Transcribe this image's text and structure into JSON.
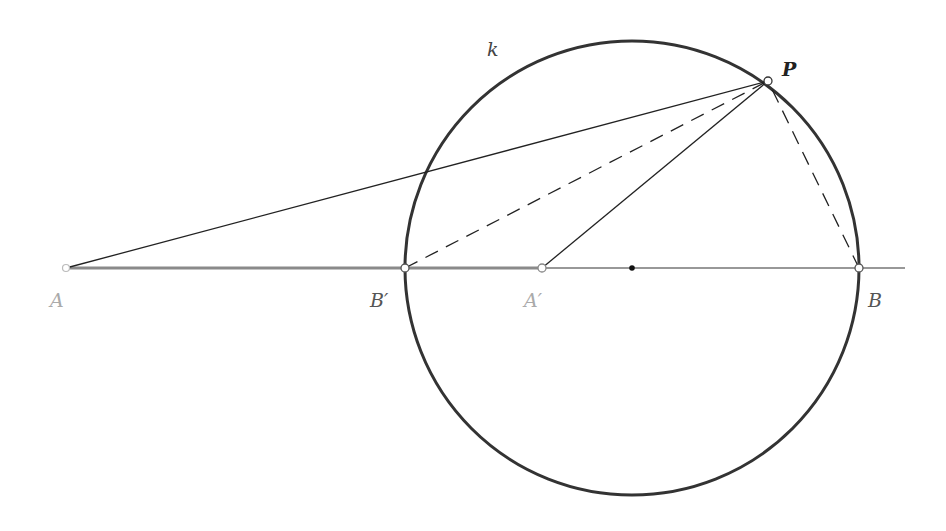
{
  "diagram": {
    "circle": {
      "label": "k",
      "cx": 632,
      "cy": 268,
      "r": 227,
      "color": "#333333"
    },
    "line": {
      "x1": 66,
      "y1": 268,
      "x2": 905,
      "y2": 268
    },
    "points": {
      "A": {
        "label": "A",
        "x": 66,
        "y": 268,
        "color": "#aaaaaa"
      },
      "B_prime": {
        "label": "B′",
        "x": 405,
        "y": 268,
        "color": "#555555"
      },
      "A_prime": {
        "label": "A′",
        "x": 542,
        "y": 268,
        "color": "#aaaaaa"
      },
      "center": {
        "label": "",
        "x": 632,
        "y": 268
      },
      "B": {
        "label": "B",
        "x": 859,
        "y": 268,
        "color": "#555555"
      },
      "P": {
        "label": "P",
        "x": 768,
        "y": 81,
        "color": "#222222"
      }
    },
    "segments": [
      {
        "from": "A",
        "to": "P",
        "style": "solid"
      },
      {
        "from": "A_prime",
        "to": "P",
        "style": "solid"
      },
      {
        "from": "B_prime",
        "to": "P",
        "style": "dashed"
      },
      {
        "from": "B",
        "to": "P",
        "style": "dashed"
      },
      {
        "from": "A",
        "to": "A_prime",
        "style": "thick-gray"
      }
    ]
  }
}
